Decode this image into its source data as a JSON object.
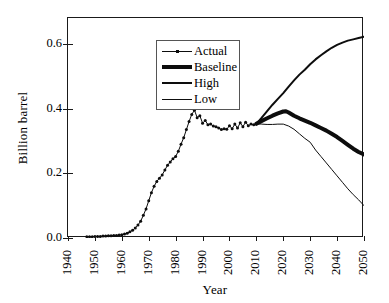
{
  "chart_data": {
    "type": "line",
    "title": "",
    "xlabel": "Year",
    "ylabel": "Billion barrel",
    "xlim": [
      1940,
      2050
    ],
    "ylim": [
      0.0,
      0.68
    ],
    "grid": false,
    "legend_position": "top-left",
    "xticks": [
      1940,
      1950,
      1960,
      1970,
      1980,
      1990,
      2000,
      2010,
      2020,
      2030,
      2040,
      2050
    ],
    "xtick_labels": [
      "1940",
      "1950",
      "1960",
      "1970",
      "1980",
      "1990",
      "2000",
      "2010",
      "2020",
      "2030",
      "2040",
      "2050"
    ],
    "yticks": [
      0.0,
      0.2,
      0.4,
      0.6
    ],
    "ytick_labels": [
      "0.0",
      "0.2",
      "0.4",
      "0.6"
    ],
    "series": [
      {
        "name": "Actual",
        "style": "thin-with-markers",
        "color": "#0d0d0d",
        "width": 1,
        "marker": "dot",
        "x": [
          1947,
          1948,
          1949,
          1950,
          1951,
          1952,
          1953,
          1954,
          1955,
          1956,
          1957,
          1958,
          1959,
          1960,
          1961,
          1962,
          1963,
          1964,
          1965,
          1966,
          1967,
          1968,
          1969,
          1970,
          1971,
          1972,
          1973,
          1974,
          1975,
          1976,
          1977,
          1978,
          1979,
          1980,
          1981,
          1982,
          1983,
          1984,
          1985,
          1986,
          1987,
          1988,
          1989,
          1990,
          1991,
          1992,
          1993,
          1994,
          1995,
          1996,
          1997,
          1998,
          1999,
          2000,
          2001,
          2002,
          2003,
          2004,
          2005,
          2006,
          2007,
          2008,
          2009,
          2010
        ],
        "y": [
          0.004,
          0.004,
          0.004,
          0.005,
          0.005,
          0.005,
          0.006,
          0.006,
          0.007,
          0.007,
          0.008,
          0.008,
          0.009,
          0.01,
          0.012,
          0.015,
          0.019,
          0.024,
          0.031,
          0.04,
          0.052,
          0.07,
          0.09,
          0.115,
          0.14,
          0.16,
          0.175,
          0.185,
          0.195,
          0.21,
          0.225,
          0.235,
          0.245,
          0.252,
          0.268,
          0.29,
          0.31,
          0.335,
          0.36,
          0.382,
          0.395,
          0.372,
          0.378,
          0.355,
          0.363,
          0.35,
          0.352,
          0.346,
          0.344,
          0.34,
          0.335,
          0.338,
          0.336,
          0.347,
          0.338,
          0.352,
          0.34,
          0.356,
          0.344,
          0.358,
          0.347,
          0.352,
          0.35,
          0.353
        ]
      },
      {
        "name": "Baseline",
        "style": "very-thick",
        "color": "#0d0d0d",
        "width": 4,
        "x": [
          2010,
          2012,
          2014,
          2016,
          2018,
          2020,
          2021,
          2022,
          2024,
          2026,
          2028,
          2030,
          2032,
          2034,
          2036,
          2038,
          2040,
          2042,
          2044,
          2046,
          2048,
          2050
        ],
        "y": [
          0.353,
          0.362,
          0.37,
          0.378,
          0.385,
          0.391,
          0.392,
          0.388,
          0.378,
          0.37,
          0.363,
          0.356,
          0.348,
          0.34,
          0.332,
          0.322,
          0.312,
          0.3,
          0.288,
          0.276,
          0.266,
          0.258
        ]
      },
      {
        "name": "High",
        "style": "medium",
        "color": "#0d0d0d",
        "width": 2,
        "x": [
          2010,
          2012,
          2014,
          2016,
          2018,
          2020,
          2022,
          2024,
          2026,
          2028,
          2030,
          2032,
          2034,
          2036,
          2038,
          2040,
          2042,
          2044,
          2046,
          2048,
          2050
        ],
        "y": [
          0.353,
          0.372,
          0.392,
          0.412,
          0.43,
          0.448,
          0.468,
          0.487,
          0.505,
          0.52,
          0.537,
          0.552,
          0.565,
          0.577,
          0.588,
          0.597,
          0.604,
          0.61,
          0.614,
          0.618,
          0.622
        ]
      },
      {
        "name": "Low",
        "style": "thin",
        "color": "#0d0d0d",
        "width": 1,
        "x": [
          2010,
          2012,
          2014,
          2016,
          2018,
          2020,
          2022,
          2024,
          2026,
          2028,
          2030,
          2032,
          2034,
          2036,
          2038,
          2040,
          2042,
          2044,
          2046,
          2048,
          2050
        ],
        "y": [
          0.353,
          0.352,
          0.351,
          0.351,
          0.352,
          0.352,
          0.346,
          0.336,
          0.322,
          0.308,
          0.296,
          0.272,
          0.252,
          0.232,
          0.212,
          0.192,
          0.172,
          0.152,
          0.134,
          0.118,
          0.1
        ]
      }
    ]
  },
  "legend": {
    "items": [
      {
        "label": "Actual"
      },
      {
        "label": "Baseline"
      },
      {
        "label": "High"
      },
      {
        "label": "Low"
      }
    ]
  }
}
